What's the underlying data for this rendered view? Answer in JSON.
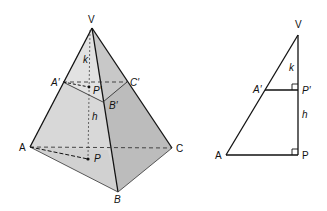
{
  "figure": {
    "colors": {
      "left_face": "#d6d6d6",
      "right_face": "#bdbdbd",
      "front_face": "#cfcfcf",
      "line": "#111111"
    }
  },
  "pyramid": {
    "labels": {
      "V": "V",
      "A_prime": "A′",
      "C_prime": "C′",
      "B_prime": "B′",
      "P_prime": "P′",
      "k": "k",
      "h": "h",
      "A": "A",
      "P": "P",
      "C": "C",
      "B": "B"
    }
  },
  "triangle": {
    "labels": {
      "V": "V",
      "k": "k",
      "A_prime": "A′",
      "P_prime": "P′",
      "h": "h",
      "A": "A",
      "P": "P"
    }
  }
}
